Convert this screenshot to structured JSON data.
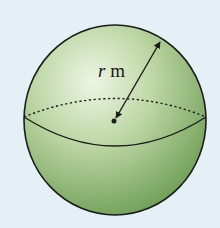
{
  "diagram": {
    "type": "sphere",
    "label": {
      "variable": "r",
      "unit": "m"
    },
    "colors": {
      "background": "#e4f0f6",
      "sphere_light": "#e6f0d8",
      "sphere_mid": "#a9c98e",
      "sphere_dark": "#6f9f55",
      "outline": "#1c1c1c"
    }
  }
}
